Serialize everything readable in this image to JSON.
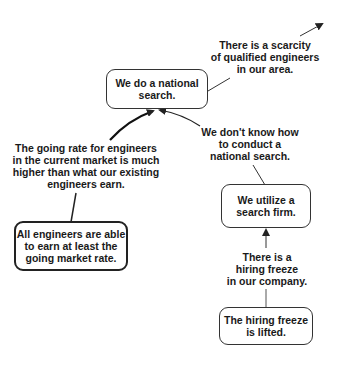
{
  "diagram": {
    "type": "logic-tree",
    "nodes": [
      {
        "id": "national-search",
        "kind": "box",
        "text": "We do a national\nsearch."
      },
      {
        "id": "scarcity",
        "kind": "label",
        "text": "There is a scarcity\nof qualified engineers\nin our area."
      },
      {
        "id": "going-rate",
        "kind": "label",
        "text": "The going rate for engineers\nin the current market is much\nhigher than what our existing\nengineers earn."
      },
      {
        "id": "all-earn",
        "kind": "box",
        "text": "All engineers are able\nto earn at least the\ngoing market rate."
      },
      {
        "id": "dont-know",
        "kind": "label",
        "text": "We don't know how\nto conduct a\nnational search."
      },
      {
        "id": "search-firm",
        "kind": "box",
        "text": "We utilize a\nsearch firm."
      },
      {
        "id": "hiring-freeze",
        "kind": "label",
        "text": "There is a\nhiring freeze\nin our company."
      },
      {
        "id": "freeze-lifted",
        "kind": "box",
        "text": "The hiring freeze\nis lifted."
      }
    ],
    "edges": [
      {
        "from": "national-search",
        "to": "offscreen-top-right",
        "via": "scarcity",
        "arrow": true
      },
      {
        "from": "going-rate",
        "to": "national-search",
        "arrow": true,
        "style": "thick"
      },
      {
        "from": "all-earn",
        "to": "going-rate",
        "arrow": false
      },
      {
        "from": "dont-know",
        "to": "national-search",
        "arrow": true
      },
      {
        "from": "search-firm",
        "to": "dont-know",
        "arrow": false
      },
      {
        "from": "hiring-freeze",
        "to": "search-firm",
        "arrow": true
      },
      {
        "from": "freeze-lifted",
        "to": "hiring-freeze",
        "arrow": false
      }
    ],
    "colors": {
      "line": "#222222",
      "box_border": "#333333",
      "text": "#1a1a1a",
      "background": "#ffffff"
    }
  }
}
